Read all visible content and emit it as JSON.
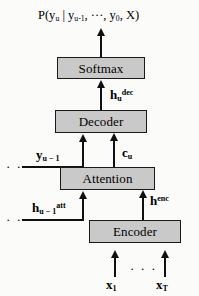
{
  "diagram": {
    "output_formula": {
      "prefix": "P(y",
      "sub_1": "u",
      "mid": " | y",
      "sub_2": "u-1",
      "ellipsis": ", ···, y",
      "sub_3": "0",
      "suffix": ", X)"
    },
    "nodes": [
      {
        "id": "softmax",
        "label": "Softmax",
        "fill": "#c9c9c9",
        "border": "#1a1a1a"
      },
      {
        "id": "decoder",
        "label": "Decoder",
        "fill": "#c9c9c9",
        "border": "#1a1a1a"
      },
      {
        "id": "attention",
        "label": "Attention",
        "fill": "#c9c9c9",
        "border": "#1a1a1a"
      },
      {
        "id": "encoder",
        "label": "Encoder",
        "fill": "#c9c9c9",
        "border": "#1a1a1a"
      }
    ],
    "edge_labels": {
      "h_dec": {
        "base": "h",
        "sub": "u",
        "sup": "dec"
      },
      "y_prev": {
        "base": "y",
        "sub": "u − 1",
        "sup": ""
      },
      "c_u": {
        "base": "c",
        "sub": "u",
        "sup": ""
      },
      "h_att": {
        "base": "h",
        "sub": "u − 1",
        "sup": "att"
      },
      "h_enc": {
        "base": "h",
        "sub": "",
        "sup": "enc"
      }
    },
    "inputs": {
      "first": {
        "base": "x",
        "sub": "1"
      },
      "last": {
        "base": "x",
        "sub": "T"
      },
      "ellipsis": "· · ·"
    },
    "recurrence_ellipsis": "· · ·",
    "colors": {
      "box_fill": "#c9c9c9",
      "line": "#101010",
      "background": "#fbfbfa",
      "text": "#000000"
    }
  }
}
